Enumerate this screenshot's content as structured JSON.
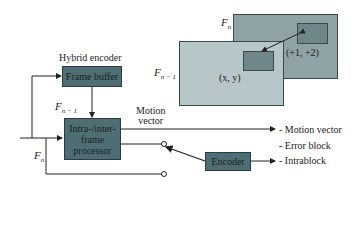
{
  "title": "Hybrid encoder",
  "blocks": {
    "frame_buffer": "Frame buffer",
    "processor": "Intra-/inter-frame processor",
    "processor_lines": [
      "Intra-/inter-",
      "frame",
      "processor"
    ],
    "encoder": "Encoder"
  },
  "labels": {
    "f_prev_main": "F",
    "f_prev_sub": "n − 1",
    "f_cur": "F",
    "f_cur_sub": "n",
    "motion_vector": [
      "Motion",
      "vector"
    ],
    "frame_fn": "F",
    "frame_fn_sub": "n",
    "frame_fprev": "F",
    "frame_fprev_sub": "n − 1",
    "coord_xy": "(x, y)",
    "coord_offset": "(+1, +2)"
  },
  "outputs": [
    "- Motion vector",
    "- Error block",
    "- Intrablock"
  ],
  "colors": {
    "block_fill": "#4e6e74",
    "frame_fn": "#8fa2a5",
    "frame_fprev": "#b7c6c8",
    "inner_block": "#6f878b"
  }
}
